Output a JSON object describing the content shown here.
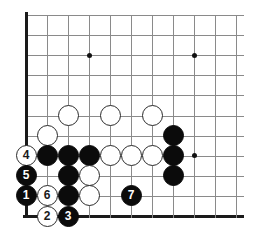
{
  "diagram": {
    "type": "go-board-corner-diagram",
    "board": {
      "columns": 11,
      "rows": 11,
      "origin_x": 26,
      "origin_y": 15,
      "spacing_x": 21,
      "spacing_y": 20.1,
      "stone_radius": 10.5,
      "grid_color": "#8a8a8a",
      "edge_color": "#1a1a1a",
      "background": "#ffffff",
      "left_edge_is_border": true,
      "bottom_edge_is_border": true
    },
    "star_points": [
      {
        "col": 3,
        "row": 2
      },
      {
        "col": 8,
        "row": 2
      },
      {
        "col": 8,
        "row": 7
      }
    ],
    "stones": [
      {
        "id": "w-a",
        "color": "white",
        "col": 2,
        "row": 5,
        "label": ""
      },
      {
        "id": "w-b",
        "color": "white",
        "col": 4,
        "row": 5,
        "label": ""
      },
      {
        "id": "w-c",
        "color": "white",
        "col": 6,
        "row": 5,
        "label": ""
      },
      {
        "id": "w-d",
        "color": "white",
        "col": 1,
        "row": 6,
        "label": ""
      },
      {
        "id": "w-4",
        "color": "white",
        "col": 0,
        "row": 7,
        "label": "4"
      },
      {
        "id": "b-a",
        "color": "black",
        "col": 1,
        "row": 7,
        "label": ""
      },
      {
        "id": "b-b",
        "color": "black",
        "col": 2,
        "row": 7,
        "label": ""
      },
      {
        "id": "b-c",
        "color": "black",
        "col": 3,
        "row": 7,
        "label": ""
      },
      {
        "id": "w-e",
        "color": "white",
        "col": 4,
        "row": 7,
        "label": ""
      },
      {
        "id": "w-f",
        "color": "white",
        "col": 5,
        "row": 7,
        "label": ""
      },
      {
        "id": "w-g",
        "color": "white",
        "col": 6,
        "row": 7,
        "label": ""
      },
      {
        "id": "b-r1",
        "color": "black",
        "col": 7,
        "row": 6,
        "label": ""
      },
      {
        "id": "b-r2",
        "color": "black",
        "col": 7,
        "row": 7,
        "label": ""
      },
      {
        "id": "b-r3",
        "color": "black",
        "col": 7,
        "row": 8,
        "label": ""
      },
      {
        "id": "b-5",
        "color": "black",
        "col": 0,
        "row": 8,
        "label": "5"
      },
      {
        "id": "b-d",
        "color": "black",
        "col": 2,
        "row": 8,
        "label": ""
      },
      {
        "id": "w-h",
        "color": "white",
        "col": 3,
        "row": 8,
        "label": ""
      },
      {
        "id": "b-1",
        "color": "black",
        "col": 0,
        "row": 9,
        "label": "1"
      },
      {
        "id": "w-6",
        "color": "white",
        "col": 1,
        "row": 9,
        "label": "6"
      },
      {
        "id": "b-e",
        "color": "black",
        "col": 2,
        "row": 9,
        "label": ""
      },
      {
        "id": "w-i",
        "color": "white",
        "col": 3,
        "row": 9,
        "label": ""
      },
      {
        "id": "b-7",
        "color": "black",
        "col": 5,
        "row": 9,
        "label": "7"
      },
      {
        "id": "w-2",
        "color": "white",
        "col": 1,
        "row": 10,
        "label": "2"
      },
      {
        "id": "b-3",
        "color": "black",
        "col": 2,
        "row": 10,
        "label": "3"
      }
    ],
    "move_sequence": [
      "1",
      "2",
      "3",
      "4",
      "5",
      "6",
      "7"
    ]
  }
}
